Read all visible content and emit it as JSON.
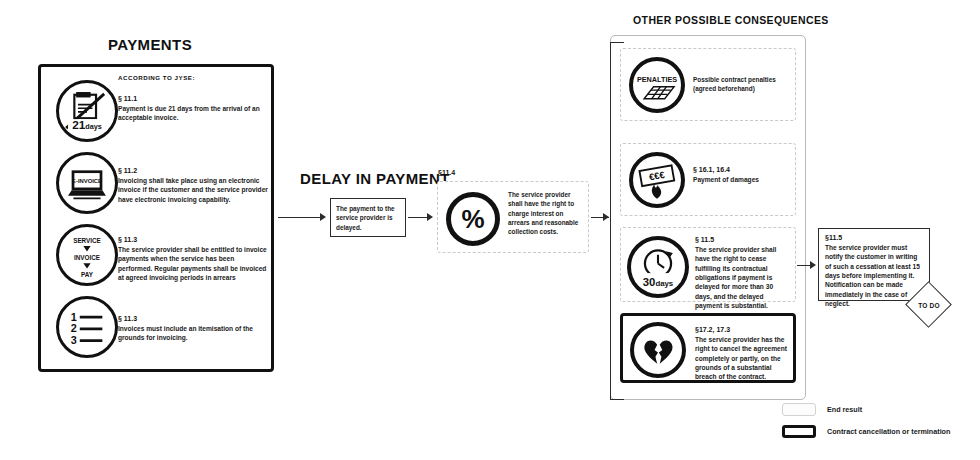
{
  "headings": {
    "payments": "PAYMENTS",
    "delay": "DELAY IN PAYMENT",
    "other_consequences": "OTHER POSSIBLE CONSEQUENCES"
  },
  "payments_panel": {
    "according_to": "ACCORDING TO JYSE:",
    "items": [
      {
        "icon": "invoice-21days-icon",
        "icon_label": "21days",
        "icon_sub": "INVOICE",
        "clause": "§ 11.1",
        "text": "Payment is due 21 days from the arrival of an acceptable invoice."
      },
      {
        "icon": "e-invoice-laptop-icon",
        "icon_label": "E-INVOICE",
        "clause": "§ 11.2",
        "text": "Invoicing shall take place using an electronic invoice if the customer and the service provider have electronic invoicing capability."
      },
      {
        "icon": "service-invoice-pay-icon",
        "icon_label": "SERVICE ▼ INVOICE ▼ PAY",
        "clause": "§ 11.3",
        "text": "The service provider shall be entitled to invoice payments when the service has been performed. Regular payments shall be invoiced at agreed invoicing periods in arrears"
      },
      {
        "icon": "itemised-list-icon",
        "icon_label": "1 2 3",
        "clause": "§ 11.3",
        "text": "Invoices must include an itemisation of the grounds for invoicing."
      }
    ]
  },
  "delay_flow": {
    "delay_box_text": "The payment to the service provider is delayed.",
    "interest_clause_label": "§11.4",
    "interest_icon": "percent-icon",
    "interest_icon_label": "%",
    "interest_text": "The service provider shall have the right to charge interest on arrears and reasonable collection costs."
  },
  "consequences": [
    {
      "icon": "penalties-icon",
      "icon_label": "PENALTIES",
      "clause": "",
      "text": "Possible contract penalties (agreed beforehand)",
      "style": "light"
    },
    {
      "icon": "burning-money-icon",
      "icon_label": "€€€",
      "clause": "§ 16.1, 16.4",
      "text": "Payment of damages",
      "style": "light"
    },
    {
      "icon": "clock-30days-icon",
      "icon_label": "30days",
      "clause": "§ 11.5",
      "text": "The service provider shall have the right to cease fulfilling its contractual obligations if payment is delayed for more than 30 days, and the delayed payment is substantial.",
      "style": "light"
    },
    {
      "icon": "broken-heart-icon",
      "icon_label": "",
      "clause": "§17.2, 17.3",
      "text": "The service provider has the right to cancel the agreement completely or partly, on the grounds of a substantial breach of the contract.",
      "style": "strong"
    }
  ],
  "result": {
    "clause": "§11.5",
    "text": "The service provider must notify the customer in writing of such a cessation at least 15 days before implementing it. Notification can be made immediately in the case of neglect.",
    "todo_label": "TO DO"
  },
  "legend": [
    {
      "swatch": "light",
      "label": "End result"
    },
    {
      "swatch": "dark",
      "label": "Contract cancellation or termination"
    }
  ],
  "colors": {
    "ink": "#111111",
    "line": "#2b2b2b",
    "light_border": "#c9c9c9",
    "container_border": "#b9b9b9"
  }
}
